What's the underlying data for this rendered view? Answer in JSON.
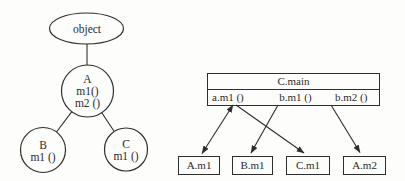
{
  "figure": {
    "left_tree": {
      "root_label": "object",
      "classes": [
        {
          "name": "A",
          "methods": [
            "m1()",
            "m2 ()"
          ]
        },
        {
          "name": "B",
          "methods": [
            "m1 ()"
          ]
        },
        {
          "name": "C",
          "methods": [
            "m1 ()"
          ]
        }
      ]
    },
    "dispatch_table": {
      "header": "C.main",
      "calls": [
        "a.m1 ()",
        "b.m1 ()",
        "b.m2 ()"
      ]
    },
    "method_boxes": [
      "A.m1",
      "B.m1",
      "C.m1",
      "A.m2"
    ],
    "arrows": [
      {
        "from": "a.m1 ()",
        "to": "A.m1",
        "double_headed": true
      },
      {
        "from": "a.m1 ()",
        "to": "C.m1",
        "double_headed": false
      },
      {
        "from": "b.m1 ()",
        "to": "B.m1",
        "double_headed": false
      },
      {
        "from": "b.m2 ()",
        "to": "A.m2",
        "double_headed": false
      }
    ],
    "colors": {
      "stroke": "#2e2e2e",
      "text": "#2b2b2b",
      "background": "#fdfdfc"
    }
  }
}
